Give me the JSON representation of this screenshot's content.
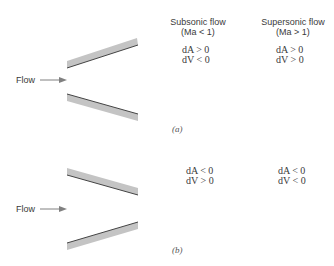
{
  "columns": {
    "subsonic": {
      "title": "Subsonic flow",
      "condition": "(Ma < 1)"
    },
    "supersonic": {
      "title": "Supersonic flow",
      "condition": "(Ma > 1)"
    }
  },
  "panels": [
    {
      "label": "(a)",
      "flow_label": "Flow",
      "geometry": "diverging",
      "subsonic": {
        "dA": "dA > 0",
        "dV": "dV < 0"
      },
      "supersonic": {
        "dA": "dA > 0",
        "dV": "dV > 0"
      }
    },
    {
      "label": "(b)",
      "flow_label": "Flow",
      "geometry": "converging",
      "subsonic": {
        "dA": "dA < 0",
        "dV": "dV > 0"
      },
      "supersonic": {
        "dA": "dA < 0",
        "dV": "dV < 0"
      }
    }
  ],
  "colors": {
    "wall_fill": "#c4c4c4",
    "wall_edge": "#444444",
    "arrow": "#808080",
    "text": "#3a3a3a"
  }
}
